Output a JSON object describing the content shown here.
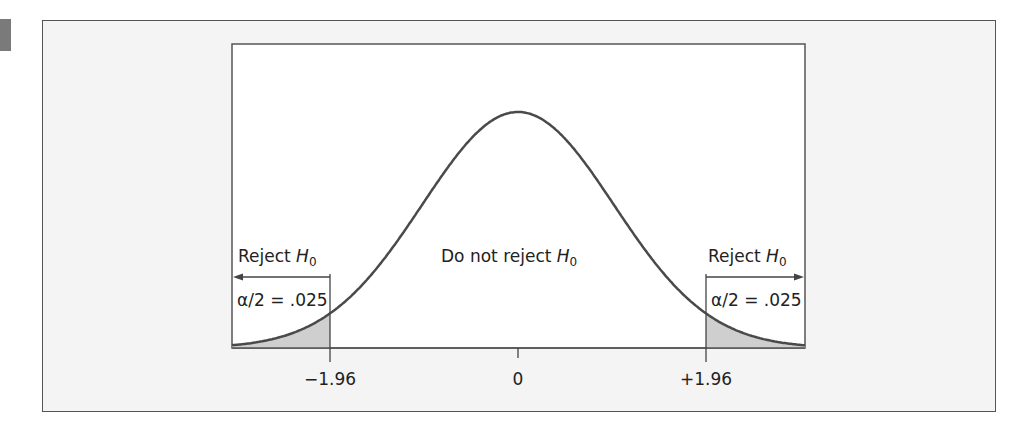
{
  "chart_data": {
    "type": "area",
    "title": "",
    "xlabel": "",
    "ylabel": "",
    "distribution": "standard normal",
    "x_ticks": [
      "−1.96",
      "0",
      "+1.96"
    ],
    "x_tick_values": [
      -1.96,
      0,
      1.96
    ],
    "xlim": [
      -3,
      3
    ],
    "regions": [
      {
        "name": "left rejection region",
        "label": "Reject H0",
        "range": [
          -3,
          -1.96
        ],
        "area_label": "α/2 = .025",
        "area": 0.025,
        "shaded": true
      },
      {
        "name": "non-rejection region",
        "label": "Do not reject H0",
        "range": [
          -1.96,
          1.96
        ],
        "area": 0.95,
        "shaded": false
      },
      {
        "name": "right rejection region",
        "label": "Reject H0",
        "range": [
          1.96,
          3
        ],
        "area_label": "α/2 = .025",
        "area": 0.025,
        "shaded": true
      }
    ],
    "grid": false,
    "legend": "none"
  },
  "labels": {
    "reject_left": "Reject ",
    "reject_right": "Reject ",
    "do_not_reject": "Do not reject ",
    "h": "H",
    "sub": "0",
    "alpha_left": "α/2 = .025",
    "alpha_right": "α/2 = .025",
    "tick_neg": "−1.96",
    "tick_zero": "0",
    "tick_pos": "+1.96"
  },
  "colors": {
    "curve": "#4a4a4a",
    "shade": "#cfcfcf",
    "frame_bg": "#f4f4f4",
    "plot_bg": "#ffffff"
  }
}
